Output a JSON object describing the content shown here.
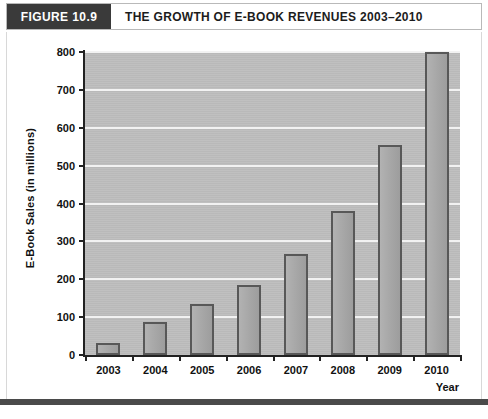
{
  "header": {
    "figure_tag": "FIGURE 10.9",
    "title": "THE GROWTH OF E-BOOK REVENUES 2003–2010"
  },
  "colors": {
    "header_tag_bg": "#3a3a3a",
    "plot_bg": "#bdbdbd",
    "gridline": "#f2f2f2",
    "bar_fill": "#a9a9a9",
    "bar_border": "#585858",
    "axis": "#222222",
    "rule": "#4a4a4a"
  },
  "chart_data": {
    "type": "bar",
    "title": "THE GROWTH OF E-BOOK REVENUES 2003–2010",
    "xlabel": "Year",
    "ylabel": "E-Book Sales (in millions)",
    "categories": [
      "2003",
      "2004",
      "2005",
      "2006",
      "2007",
      "2008",
      "2009",
      "2010"
    ],
    "values": [
      32,
      87,
      135,
      185,
      268,
      381,
      554,
      800
    ],
    "ylim": [
      0,
      800
    ],
    "yticks": [
      0,
      100,
      200,
      300,
      400,
      500,
      600,
      700,
      800
    ],
    "ytick_labels": [
      "0",
      "100",
      "200",
      "300",
      "400",
      "500",
      "600",
      "700",
      "800"
    ],
    "grid": true,
    "legend": "none"
  }
}
